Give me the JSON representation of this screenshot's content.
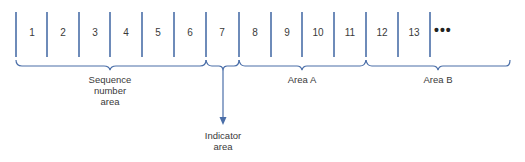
{
  "diagram": {
    "type": "record-layout",
    "line_color": "#4a6ea8",
    "cells": [
      {
        "label": "1"
      },
      {
        "label": "2"
      },
      {
        "label": "3"
      },
      {
        "label": "4"
      },
      {
        "label": "5"
      },
      {
        "label": "6"
      },
      {
        "label": "7"
      },
      {
        "label": "8"
      },
      {
        "label": "9"
      },
      {
        "label": "10"
      },
      {
        "label": "11"
      },
      {
        "label": "12"
      },
      {
        "label": "13"
      }
    ],
    "continuation": "•••",
    "groups": [
      {
        "name": "sequence-number-area",
        "line1": "Sequence",
        "line2": "number",
        "line3": "area",
        "cells": "1-6"
      },
      {
        "name": "indicator-area",
        "line1": "Indicator",
        "line2": "area",
        "cells": "7"
      },
      {
        "name": "area-a",
        "line1": "Area A",
        "cells": "8-11"
      },
      {
        "name": "area-b",
        "line1": "Area B",
        "cells": "12-"
      }
    ]
  }
}
